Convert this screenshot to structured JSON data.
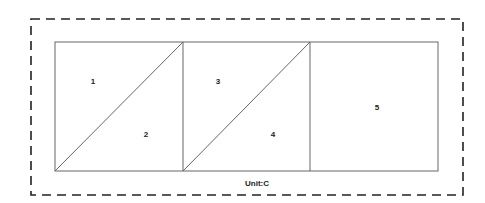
{
  "diagram": {
    "outer_border": {
      "style": "dashed",
      "color": "#222222"
    },
    "regions": [
      {
        "id": "1",
        "label": "1"
      },
      {
        "id": "2",
        "label": "2"
      },
      {
        "id": "3",
        "label": "3"
      },
      {
        "id": "4",
        "label": "4"
      },
      {
        "id": "5",
        "label": "5"
      }
    ],
    "unit_label": "Unit:C",
    "line_color": "#555555"
  }
}
